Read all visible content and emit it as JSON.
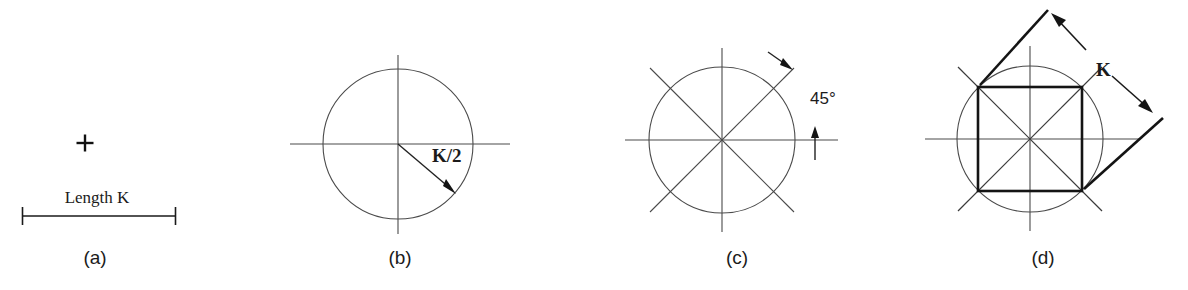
{
  "figure": {
    "background_color": "#ffffff",
    "line_color": "#4a4a4a",
    "bold_line_color": "#111111",
    "text_color": "#1b1b1b",
    "width": 1188,
    "height": 290
  },
  "panels": [
    {
      "id": "a",
      "caption": "(a)",
      "caption_x": 95,
      "caption_y": 264,
      "labels": [
        {
          "name": "length-label",
          "text": "Length K",
          "x": 97,
          "y": 203,
          "style": "serif"
        }
      ],
      "marks": {
        "plus_center_x": 85,
        "plus_center_y": 143,
        "plus_size": 17,
        "dimension_line": {
          "x1": 22,
          "x2": 176,
          "y": 216,
          "tick_half_height": 9
        }
      }
    },
    {
      "id": "b",
      "caption": "(b)",
      "caption_x": 400,
      "caption_y": 264,
      "circle": {
        "cx": 398,
        "cy": 144,
        "r": 75
      },
      "axes": {
        "horizontal": {
          "x1": 290,
          "x2": 510,
          "y": 144
        },
        "vertical": {
          "x": 398,
          "y1": 55,
          "y2": 234
        }
      },
      "radius_arrow": {
        "x1": 398,
        "y1": 144,
        "x2": 455,
        "y2": 193
      },
      "labels": [
        {
          "name": "radius-label",
          "text": "K/2",
          "x": 432,
          "y": 162,
          "style": "serif-bold"
        }
      ]
    },
    {
      "id": "c",
      "caption": "(c)",
      "caption_x": 737,
      "caption_y": 264,
      "circle": {
        "cx": 722,
        "cy": 140,
        "r": 73
      },
      "axes": {
        "horizontal": {
          "x1": 625,
          "x2": 838,
          "y": 140
        },
        "vertical": {
          "x": 722,
          "y1": 48,
          "y2": 232
        }
      },
      "diagonals": [
        {
          "x1": 650,
          "y1": 68,
          "x2": 794,
          "y2": 212
        },
        {
          "x1": 650,
          "y1": 212,
          "x2": 794,
          "y2": 68
        }
      ],
      "angle_annotation": {
        "text": "45°",
        "text_x": 810,
        "text_y": 104,
        "arrow_top": {
          "x1": 768,
          "y1": 52,
          "x2": 792,
          "y2": 70
        },
        "arrow_bottom": {
          "x1": 815,
          "y1": 160,
          "x2": 815,
          "y2": 128
        }
      }
    },
    {
      "id": "d",
      "caption": "(d)",
      "caption_x": 1043,
      "caption_y": 264,
      "circle": {
        "cx": 1030,
        "cy": 139,
        "r": 73
      },
      "axes": {
        "horizontal": {
          "x1": 925,
          "x2": 1140,
          "y": 139
        },
        "vertical": {
          "x": 1030,
          "y1": 46,
          "y2": 231
        }
      },
      "diagonals": [
        {
          "x1": 958,
          "y1": 67,
          "x2": 1102,
          "y2": 211
        },
        {
          "x1": 958,
          "y1": 211,
          "x2": 1102,
          "y2": 67
        }
      ],
      "square": {
        "left": 978,
        "top": 87,
        "right": 1082,
        "bottom": 191
      },
      "dimension": {
        "label": "K",
        "label_x": 1096,
        "label_y": 76,
        "extension_upper": {
          "x1": 980,
          "y1": 85,
          "x2": 1048,
          "y2": 10
        },
        "extension_lower": {
          "x1": 1084,
          "y1": 189,
          "x2": 1163,
          "y2": 118
        },
        "arrow_upper": {
          "x1": 1086,
          "y1": 50,
          "x2": 1052,
          "y2": 14
        },
        "arrow_lower": {
          "x1": 1112,
          "y1": 76,
          "x2": 1152,
          "y2": 112
        }
      }
    }
  ]
}
